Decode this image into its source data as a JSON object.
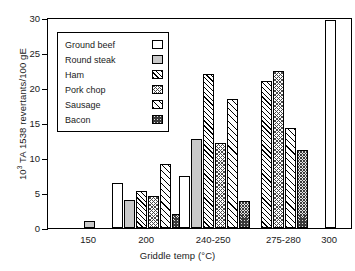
{
  "chart_data": {
    "type": "bar",
    "title": "",
    "xlabel": "Griddle temp (°C)",
    "ylabel": "10³ TA 1538 revertants/100 gE",
    "ylabel_prefix": "10",
    "ylabel_exponent": "3",
    "ylabel_suffix": " TA 1538 revertants/100 gE",
    "categories": [
      "150",
      "200",
      "240-250",
      "275-280",
      "300"
    ],
    "ylim": [
      0,
      30
    ],
    "yticks": [
      0,
      5,
      10,
      15,
      20,
      25,
      30
    ],
    "grid": false,
    "legend_position": "upper-left-inside",
    "series": [
      {
        "name": "Ground beef",
        "pattern": "open-white",
        "values": [
          null,
          6.5,
          7.4,
          null,
          29.7
        ]
      },
      {
        "name": "Round steak",
        "pattern": "solid-gray",
        "values": [
          1.0,
          4.0,
          12.7,
          null,
          null
        ]
      },
      {
        "name": "Ham",
        "pattern": "diagonal-hatch",
        "values": [
          null,
          5.3,
          22.0,
          21.0,
          null
        ]
      },
      {
        "name": "Pork chop",
        "pattern": "dotted-crosshatch",
        "values": [
          null,
          4.6,
          12.2,
          22.4,
          null
        ]
      },
      {
        "name": "Sausage",
        "pattern": "thin-diagonal",
        "values": [
          null,
          9.1,
          18.4,
          14.3,
          null
        ]
      },
      {
        "name": "Bacon",
        "pattern": "dense-stipple",
        "values": [
          null,
          2.0,
          3.8,
          11.2,
          null
        ]
      }
    ]
  },
  "legend": {
    "items": [
      {
        "label": "Ground beef"
      },
      {
        "label": "Round steak"
      },
      {
        "label": "Ham"
      },
      {
        "label": "Pork chop"
      },
      {
        "label": "Sausage"
      },
      {
        "label": "Bacon"
      }
    ]
  }
}
